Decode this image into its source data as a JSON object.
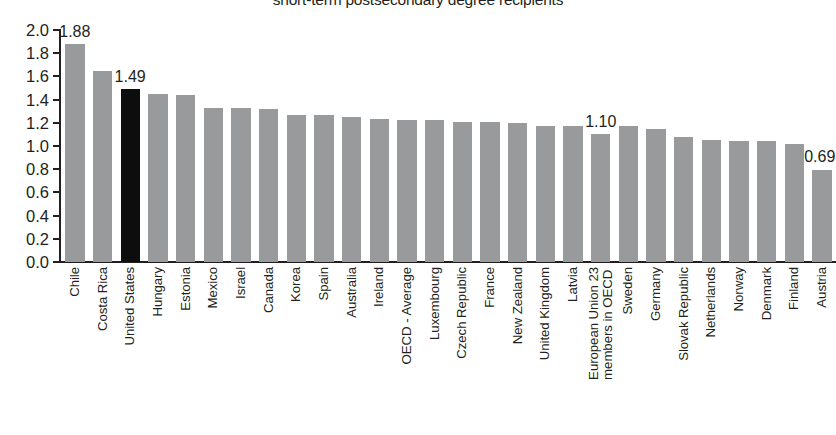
{
  "chart_data": {
    "type": "bar",
    "title": "short-term postsecondary degree recipients",
    "xlabel": "",
    "ylabel": "",
    "ylim": [
      0.0,
      2.0
    ],
    "ytick_labels": [
      "2.0",
      "1.8",
      "1.6",
      "1.4",
      "1.2",
      "1.0",
      "0.8",
      "0.6",
      "0.4",
      "0.2",
      "0.0"
    ],
    "ytick_values": [
      2.0,
      1.8,
      1.6,
      1.4,
      1.2,
      1.0,
      0.8,
      0.6,
      0.4,
      0.2,
      0.0
    ],
    "grid": false,
    "legend": null,
    "bar_color": "#999a9b",
    "highlight_color": "#0d0d0d",
    "highlight_category": "United States",
    "categories": [
      "Chile",
      "Costa Rica",
      "United States",
      "Hungary",
      "Estonia",
      "Mexico",
      "Israel",
      "Canada",
      "Korea",
      "Spain",
      "Australia",
      "Ireland",
      "OECD - Average",
      "Luxembourg",
      "Czech Republic",
      "France",
      "New Zealand",
      "United Kingdom",
      "Latvia",
      "European Union 23 members in OECD",
      "Sweden",
      "Germany",
      "Slovak Republic",
      "Netherlands",
      "Norway",
      "Denmark",
      "Finland",
      "Austria"
    ],
    "category_lines": [
      [
        "Chile"
      ],
      [
        "Costa Rica"
      ],
      [
        "United States"
      ],
      [
        "Hungary"
      ],
      [
        "Estonia"
      ],
      [
        "Mexico"
      ],
      [
        "Israel"
      ],
      [
        "Canada"
      ],
      [
        "Korea"
      ],
      [
        "Spain"
      ],
      [
        "Australia"
      ],
      [
        "Ireland"
      ],
      [
        "OECD - Average"
      ],
      [
        "Luxembourg"
      ],
      [
        "Czech Republic"
      ],
      [
        "France"
      ],
      [
        "New Zealand"
      ],
      [
        "United Kingdom"
      ],
      [
        "Latvia"
      ],
      [
        "European Union 23",
        "members in OECD"
      ],
      [
        "Sweden"
      ],
      [
        "Germany"
      ],
      [
        "Slovak Republic"
      ],
      [
        "Netherlands"
      ],
      [
        "Norway"
      ],
      [
        "Denmark"
      ],
      [
        "Finland"
      ],
      [
        "Austria"
      ]
    ],
    "values": [
      1.88,
      1.65,
      1.49,
      1.45,
      1.44,
      1.33,
      1.33,
      1.32,
      1.27,
      1.27,
      1.25,
      1.23,
      1.22,
      1.22,
      1.21,
      1.21,
      1.2,
      1.17,
      1.17,
      1.1,
      1.17,
      1.15,
      1.08,
      1.05,
      1.04,
      1.04,
      1.02,
      0.79
    ],
    "data_labels": [
      {
        "category": "Chile",
        "index": 0,
        "text": "1.88"
      },
      {
        "category": "United States",
        "index": 2,
        "text": "1.49"
      },
      {
        "category": "European Union 23 members in OECD",
        "index": 19,
        "text": "1.10"
      },
      {
        "category": "Austria",
        "index": 27,
        "text": "0.69"
      }
    ]
  }
}
